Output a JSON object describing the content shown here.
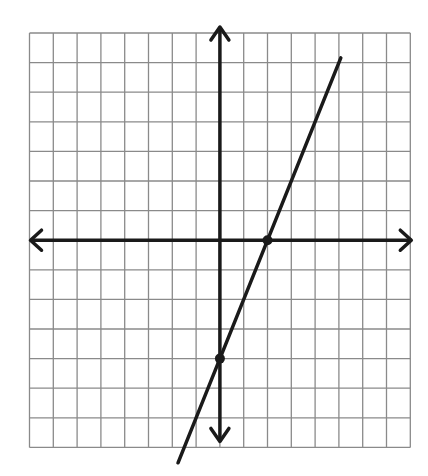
{
  "chart_data": {
    "type": "line",
    "title": "",
    "xlabel": "",
    "ylabel": "",
    "xlim": [
      -8,
      8
    ],
    "ylim": [
      -7,
      7
    ],
    "grid": true,
    "grid_step": 1,
    "axes_arrows": true,
    "equation": "y = 2x - 4",
    "slope": 2,
    "y_intercept": -4,
    "x_intercept": 2,
    "series": [
      {
        "name": "line",
        "x": [
          -1.76,
          5.08
        ],
        "y": [
          -7.52,
          6.16
        ]
      }
    ],
    "points": [
      {
        "name": "x-intercept",
        "x": 2,
        "y": 0
      },
      {
        "name": "y-intercept",
        "x": 0,
        "y": -4
      }
    ]
  },
  "style": {
    "grid_color": "#8a8a8a",
    "axis_color": "#1a1a1a",
    "line_color": "#1a1a1a",
    "background": "#ffffff"
  },
  "layout": {
    "plot_left": 29.5,
    "plot_top": 33,
    "cell_w": 23.8,
    "cell_h": 29.6
  }
}
